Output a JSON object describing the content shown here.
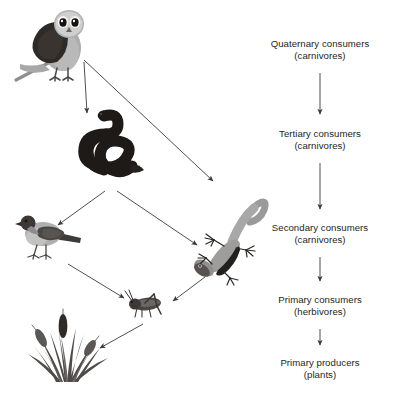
{
  "diagram": {
    "background_color": "#ffffff",
    "text_color": "#231f20",
    "arrow_color": "#3b3b3b"
  },
  "trophic_levels": [
    {
      "id": "quaternary",
      "main": "Quaternary consumers",
      "sub": "(carnivores)",
      "x": 320,
      "y": 38
    },
    {
      "id": "tertiary",
      "main": "Tertiary consumers",
      "sub": "(carnivores)",
      "x": 320,
      "y": 128
    },
    {
      "id": "secondary",
      "main": "Secondary consumers",
      "sub": "(carnivores)",
      "x": 320,
      "y": 222
    },
    {
      "id": "primary-consumers",
      "main": "Primary consumers",
      "sub": "(herbivores)",
      "x": 320,
      "y": 294
    },
    {
      "id": "primary-producers",
      "main": "Primary producers",
      "sub": "(plants)",
      "x": 320,
      "y": 357
    }
  ],
  "organisms": [
    {
      "id": "owl",
      "name": "owl",
      "level": "quaternary",
      "x": 10,
      "y": 4,
      "width": 86,
      "height": 80
    },
    {
      "id": "snake",
      "name": "snake",
      "level": "tertiary",
      "x": 74,
      "y": 104,
      "width": 82,
      "height": 84
    },
    {
      "id": "bird",
      "name": "bird",
      "level": "secondary",
      "x": 17,
      "y": 208,
      "width": 68,
      "height": 56
    },
    {
      "id": "lizard",
      "name": "lizard",
      "level": "secondary",
      "x": 188,
      "y": 184,
      "width": 82,
      "height": 102
    },
    {
      "id": "grasshopper",
      "name": "grasshopper",
      "level": "primary-consumers",
      "x": 123,
      "y": 288,
      "width": 46,
      "height": 34
    },
    {
      "id": "grass",
      "name": "grass",
      "level": "primary-producers",
      "x": 20,
      "y": 308,
      "width": 92,
      "height": 76
    }
  ],
  "food_chain_arrows": [
    {
      "id": "owl-to-snake",
      "from": "owl",
      "to": "snake"
    },
    {
      "id": "owl-to-lizard",
      "from": "owl",
      "to": "lizard"
    },
    {
      "id": "snake-to-bird",
      "from": "snake",
      "to": "bird"
    },
    {
      "id": "snake-to-lizard",
      "from": "snake",
      "to": "lizard"
    },
    {
      "id": "bird-to-grasshopper",
      "from": "bird",
      "to": "grasshopper"
    },
    {
      "id": "lizard-to-grasshopper",
      "from": "lizard",
      "to": "grasshopper"
    },
    {
      "id": "grasshopper-to-grass",
      "from": "grasshopper",
      "to": "grass"
    }
  ],
  "level_arrows": [
    {
      "id": "quaternary-to-tertiary",
      "from": "quaternary",
      "to": "tertiary"
    },
    {
      "id": "tertiary-to-secondary",
      "from": "tertiary",
      "to": "secondary"
    },
    {
      "id": "secondary-to-primary-consumers",
      "from": "secondary",
      "to": "primary-consumers"
    },
    {
      "id": "primary-consumers-to-primary-producers",
      "from": "primary-consumers",
      "to": "primary-producers"
    }
  ]
}
